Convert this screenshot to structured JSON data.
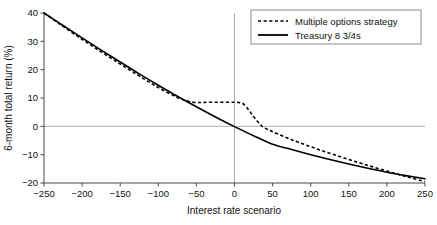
{
  "chart_data": {
    "type": "line",
    "title": "",
    "xlabel": "Interest rate scenario",
    "ylabel": "6-month total return (%)",
    "xlim": [
      -250,
      250
    ],
    "ylim": [
      -20,
      40
    ],
    "xticks": [
      -250,
      -200,
      -150,
      -100,
      -50,
      0,
      50,
      100,
      150,
      200,
      250
    ],
    "xtick_labels": [
      "−250",
      "−200",
      "−150",
      "−100",
      "−50",
      "0",
      "50",
      "100",
      "150",
      "200",
      "250"
    ],
    "yticks": [
      40,
      30,
      20,
      10,
      0,
      -10,
      -20
    ],
    "ytick_labels": [
      "40",
      "30",
      "20",
      "10",
      "0",
      "−10",
      "−20"
    ],
    "grid": "zero-lines-only",
    "zero_gridlines": {
      "horizontal_y": 0,
      "vertical_x": 0,
      "color": "#b0b0b0"
    },
    "legend_position": "top-right",
    "series": [
      {
        "name": "Multiple options strategy",
        "style": "dotted",
        "color": "#000000",
        "x": [
          -250,
          -225,
          -200,
          -175,
          -150,
          -125,
          -100,
          -75,
          -60,
          -50,
          -45,
          -40,
          -35,
          -25,
          -15,
          -5,
          0,
          5,
          10,
          15,
          20,
          25,
          30,
          35,
          40,
          50,
          75,
          100,
          125,
          150,
          175,
          200,
          225,
          250
        ],
        "y": [
          40.0,
          35.3,
          30.7,
          26.3,
          22.0,
          17.8,
          13.7,
          10.2,
          8.8,
          8.4,
          8.4,
          8.4,
          8.5,
          8.5,
          8.5,
          8.5,
          8.5,
          8.4,
          8.2,
          7.0,
          5.3,
          3.5,
          1.8,
          0.3,
          -0.6,
          -1.9,
          -4.7,
          -7.2,
          -9.5,
          -11.7,
          -13.8,
          -15.8,
          -17.7,
          -19.5
        ]
      },
      {
        "name": "Treasury 8 3/4s",
        "style": "solid",
        "color": "#000000",
        "x": [
          -250,
          -225,
          -200,
          -175,
          -150,
          -125,
          -100,
          -75,
          -50,
          -25,
          0,
          25,
          50,
          75,
          100,
          125,
          150,
          175,
          200,
          225,
          250
        ],
        "y": [
          40.0,
          35.6,
          31.2,
          26.9,
          22.7,
          18.5,
          14.5,
          10.6,
          6.9,
          3.3,
          -0.1,
          -3.3,
          -6.3,
          -8.2,
          -10.0,
          -11.7,
          -13.3,
          -14.8,
          -16.2,
          -17.4,
          -18.5
        ]
      }
    ],
    "legend_entries": [
      {
        "label": "Multiple options strategy",
        "style": "dotted"
      },
      {
        "label": "Treasury 8 3/4s",
        "style": "solid"
      }
    ]
  }
}
